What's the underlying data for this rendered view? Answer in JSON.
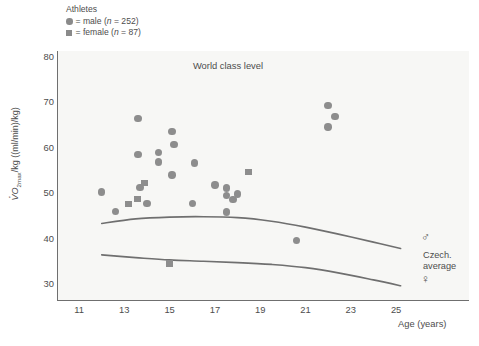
{
  "legend": {
    "title": "Athletes",
    "male_label": "= male (n = 252)",
    "male_text_pre": "= male (",
    "male_text_n": "n",
    "male_text_post": " = 252)",
    "female_text_pre": "= female (",
    "female_text_n": "n",
    "female_text_post": " = 87)"
  },
  "axes": {
    "ylabel_main": "/kg ((ml/min)/kg)",
    "ylabel_v": "V",
    "ylabel_sub": "O",
    "ylabel_sub2": "2max",
    "xlabel": "Age (years)",
    "yticks": [
      30,
      40,
      50,
      60,
      70,
      80
    ],
    "xticks": [
      11,
      13,
      15,
      17,
      19,
      21,
      23,
      25
    ],
    "ylim": [
      26,
      82
    ],
    "xlim": [
      10,
      26
    ]
  },
  "annotations": {
    "world_class": "World class level",
    "czech_line1": "Czech.",
    "czech_line2": "average",
    "male_symbol": "♂",
    "female_symbol": "♀"
  },
  "colors": {
    "marker": "#8d8d8d",
    "curve": "#6f6f6f",
    "axis": "#6f6f6f",
    "plot_bg": "#f7f7f5",
    "text": "#4d4d4d"
  },
  "chart_data": {
    "type": "scatter",
    "title": "",
    "xlabel": "Age (years)",
    "ylabel": "VO2max /kg ((ml/min)/kg)",
    "xlim": [
      10,
      26
    ],
    "ylim": [
      26,
      82
    ],
    "xticks": [
      11,
      13,
      15,
      17,
      19,
      21,
      23,
      25
    ],
    "yticks": [
      30,
      40,
      50,
      60,
      70,
      80
    ],
    "grid": false,
    "legend_position": "top-left-outside",
    "series": [
      {
        "name": "male (n = 252)",
        "marker": "circle",
        "color": "#8d8d8d",
        "points": [
          [
            12.0,
            50.2
          ],
          [
            12.6,
            45.9
          ],
          [
            13.6,
            66.4
          ],
          [
            13.6,
            58.4
          ],
          [
            13.7,
            51.2
          ],
          [
            14.0,
            47.7
          ],
          [
            14.5,
            58.9
          ],
          [
            14.5,
            56.8
          ],
          [
            15.1,
            63.5
          ],
          [
            15.1,
            54.0
          ],
          [
            15.2,
            60.7
          ],
          [
            16.0,
            47.7
          ],
          [
            16.1,
            56.6
          ],
          [
            17.0,
            51.8
          ],
          [
            17.5,
            51.1
          ],
          [
            17.5,
            49.4
          ],
          [
            17.5,
            45.8
          ],
          [
            17.8,
            48.6
          ],
          [
            18.0,
            49.8
          ],
          [
            20.6,
            39.5
          ],
          [
            22.0,
            69.2
          ],
          [
            22.0,
            64.5
          ],
          [
            22.3,
            66.8
          ]
        ]
      },
      {
        "name": "female (n = 87)",
        "marker": "square",
        "color": "#8d8d8d",
        "points": [
          [
            13.2,
            47.6
          ],
          [
            13.6,
            48.7
          ],
          [
            13.9,
            52.2
          ],
          [
            15.0,
            34.5
          ],
          [
            18.5,
            54.6
          ]
        ]
      }
    ],
    "curves": [
      {
        "name": "Czech average male",
        "points": [
          [
            12.0,
            43.3
          ],
          [
            13.5,
            44.3
          ],
          [
            15.0,
            44.7
          ],
          [
            16.5,
            44.8
          ],
          [
            18.0,
            44.6
          ],
          [
            19.5,
            43.8
          ],
          [
            21.0,
            42.5
          ],
          [
            22.5,
            40.9
          ],
          [
            24.0,
            39.2
          ],
          [
            25.2,
            37.8
          ]
        ]
      },
      {
        "name": "Czech average female",
        "points": [
          [
            12.0,
            36.4
          ],
          [
            13.5,
            35.8
          ],
          [
            15.0,
            35.3
          ],
          [
            16.5,
            35.0
          ],
          [
            18.0,
            34.7
          ],
          [
            19.5,
            34.3
          ],
          [
            21.0,
            33.6
          ],
          [
            22.5,
            32.4
          ],
          [
            24.0,
            30.9
          ],
          [
            25.2,
            29.6
          ]
        ]
      }
    ]
  }
}
